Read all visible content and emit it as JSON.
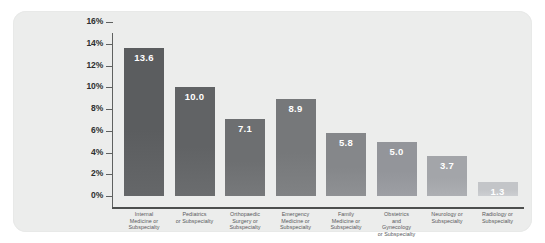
{
  "panel": {
    "background_color": "#ecedec"
  },
  "chart_data": {
    "type": "bar",
    "title": "",
    "subtitle": "",
    "xlabel": "",
    "ylabel": "",
    "ylim": [
      0,
      16
    ],
    "ytick_step": 2,
    "grid": false,
    "legend": "none",
    "value_label_position": "inside-top",
    "categories": [
      "Internal Medicine or Subspecialty",
      "Pediatrics or Subspecialty",
      "Orthopaedic Surgery or Subspecialty",
      "Emergency Medicine or Subspecialty",
      "Family Medicine or Subspecialty",
      "Obstetrics and Gynecology or Subspecialty",
      "Neurology or Subspecialty",
      "Radiology or Subspecialty"
    ],
    "category_lines": [
      [
        "Internal",
        "Medicine or",
        "Subspecialty"
      ],
      [
        "Pediatrics",
        "or Subspecialty"
      ],
      [
        "Orthopaedic",
        "Surgery or",
        "Subspecialty"
      ],
      [
        "Emergency",
        "Medicine or",
        "Subspecialty"
      ],
      [
        "Family",
        "Medicine or",
        "Subspecialty"
      ],
      [
        "Obstetrics",
        "and",
        "Gynecology",
        "or Subspecialty"
      ],
      [
        "Neurology or",
        "Subspecialty"
      ],
      [
        "Radiology or",
        "Subspecialty"
      ]
    ],
    "values": [
      13.6,
      10.0,
      7.1,
      8.9,
      5.8,
      5.0,
      3.7,
      1.3
    ],
    "value_labels": [
      "13.6",
      "10.0",
      "7.1",
      "8.9",
      "5.8",
      "5.0",
      "3.7",
      "1.3"
    ],
    "bar_colors": [
      "#5b5d5f",
      "#616365",
      "#6d6f71",
      "#76787a",
      "#85878a",
      "#93959a",
      "#a3a5a9",
      "#c3c5c8"
    ],
    "ytick_labels": [
      "16%",
      "14%",
      "12%",
      "10%",
      "8%",
      "6%",
      "4%",
      "2%",
      "0%"
    ],
    "ytick_values": [
      16,
      14,
      12,
      10,
      8,
      6,
      4,
      2,
      0
    ]
  }
}
